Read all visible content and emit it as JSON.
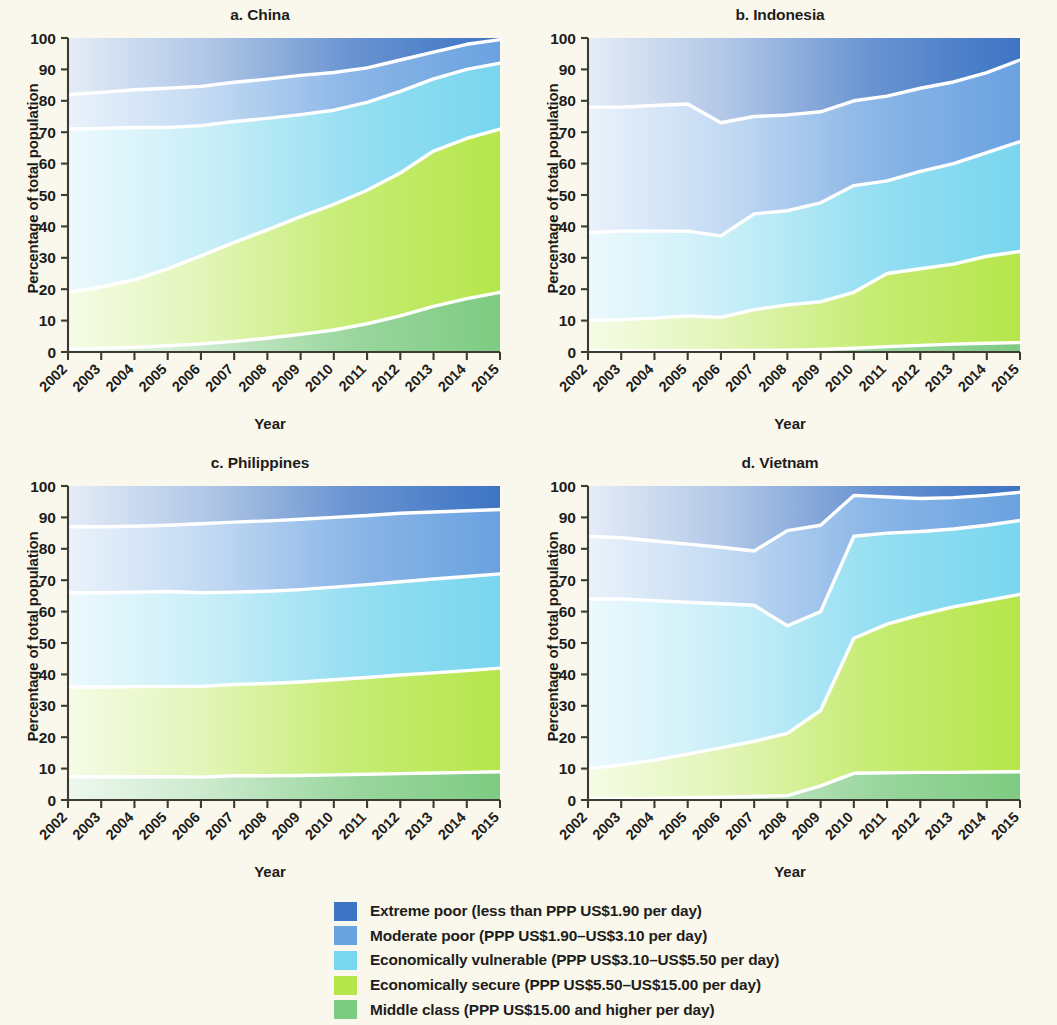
{
  "figure": {
    "background_color": "#faf8ed",
    "axis_ylabel": "Percentage of total population",
    "axis_xlabel": "Year"
  },
  "legend": {
    "position": "bottom-center",
    "items": [
      {
        "label": "Extreme poor (less than PPP US$1.90 per day)",
        "color": "#3d74c4",
        "key": "extreme_poor"
      },
      {
        "label": "Moderate poor (PPP US$1.90–US$3.10 per day)",
        "color": "#6aa2e0",
        "key": "moderate_poor"
      },
      {
        "label": "Economically vulnerable (PPP US$3.10–US$5.50 per day)",
        "color": "#78d6ee",
        "key": "economically_vulnerable"
      },
      {
        "label": "Economically secure (PPP US$5.50–US$15.00 per day)",
        "color": "#b6e64b",
        "key": "economically_secure"
      },
      {
        "label": "Middle class (PPP US$15.00 and higher per day)",
        "color": "#7ecb82",
        "key": "middle_class"
      }
    ]
  },
  "chart_data": [
    {
      "type": "area",
      "panel_id": "a",
      "title": "a. China",
      "xlabel": "Year",
      "ylabel": "Percentage of total population",
      "x": [
        2002,
        2003,
        2004,
        2005,
        2006,
        2007,
        2008,
        2009,
        2010,
        2011,
        2012,
        2013,
        2014,
        2015
      ],
      "xtick_labels": [
        "2002",
        "2003",
        "2004",
        "2005",
        "2006",
        "2007",
        "2008",
        "2009",
        "2010",
        "2011",
        "2012",
        "2013",
        "2014",
        "2015"
      ],
      "ytick_labels": [
        "0",
        "10",
        "20",
        "30",
        "40",
        "50",
        "60",
        "70",
        "80",
        "90",
        "100"
      ],
      "ylim": [
        0,
        100
      ],
      "grid": false,
      "stack_order_bottom_to_top": [
        "middle_class",
        "economically_secure",
        "economically_vulnerable",
        "moderate_poor",
        "extreme_poor"
      ],
      "series": [
        {
          "name": "Middle class (PPP US$15.00 and higher per day)",
          "color": "#7ecb82",
          "values": [
            1.0,
            1.2,
            1.5,
            2.0,
            2.6,
            3.4,
            4.4,
            5.6,
            7.0,
            9.0,
            11.5,
            14.5,
            17.0,
            19.0
          ]
        },
        {
          "name": "Economically secure (PPP US$5.50–US$15.00 per day)",
          "color": "#b6e64b",
          "values": [
            18.0,
            19.5,
            21.5,
            24.5,
            28.0,
            31.5,
            34.5,
            37.5,
            40.0,
            42.5,
            45.5,
            49.5,
            51.0,
            52.0
          ]
        },
        {
          "name": "Economically vulnerable (PPP US$3.10–US$5.50 per day)",
          "color": "#78d6ee",
          "values": [
            52.0,
            50.5,
            48.5,
            45.0,
            41.5,
            38.5,
            35.5,
            32.5,
            30.0,
            28.0,
            26.0,
            23.0,
            22.0,
            21.0
          ]
        },
        {
          "name": "Moderate poor (PPP US$1.90–US$3.10 per day)",
          "color": "#6aa2e0",
          "values": [
            11.0,
            11.5,
            12.0,
            12.5,
            12.5,
            12.5,
            12.5,
            12.5,
            12.0,
            11.0,
            10.0,
            8.5,
            8.0,
            7.5
          ]
        },
        {
          "name": "Extreme poor (less than PPP US$1.90 per day)",
          "color": "#3d74c4",
          "values": [
            18.0,
            17.3,
            16.5,
            16.0,
            15.4,
            14.1,
            13.1,
            11.9,
            11.0,
            9.5,
            7.0,
            4.5,
            2.0,
            0.5
          ]
        }
      ],
      "boundaries_cumulative": {
        "middle_class_top": [
          1.0,
          1.2,
          1.5,
          2.0,
          2.6,
          3.4,
          4.4,
          5.6,
          7.0,
          9.0,
          11.5,
          14.5,
          17.0,
          19.0
        ],
        "secure_top": [
          19.0,
          20.7,
          23.0,
          26.5,
          30.6,
          34.9,
          38.9,
          43.1,
          47.0,
          51.5,
          57.0,
          64.0,
          68.0,
          71.0
        ],
        "vulnerable_top": [
          71.0,
          71.2,
          71.5,
          71.5,
          72.1,
          73.4,
          74.4,
          75.6,
          77.0,
          79.5,
          83.0,
          87.0,
          90.0,
          92.0
        ],
        "moderate_poor_top": [
          82.0,
          82.7,
          83.5,
          84.0,
          84.6,
          85.9,
          86.9,
          88.1,
          89.0,
          90.5,
          93.0,
          95.5,
          98.0,
          99.5
        ]
      }
    },
    {
      "type": "area",
      "panel_id": "b",
      "title": "b. Indonesia",
      "xlabel": "Year",
      "ylabel": "Percentage of total population",
      "x": [
        2002,
        2003,
        2004,
        2005,
        2006,
        2007,
        2008,
        2009,
        2010,
        2011,
        2012,
        2013,
        2014,
        2015
      ],
      "xtick_labels": [
        "2002",
        "2003",
        "2004",
        "2005",
        "2006",
        "2007",
        "2008",
        "2009",
        "2010",
        "2011",
        "2012",
        "2013",
        "2014",
        "2015"
      ],
      "ytick_labels": [
        "0",
        "10",
        "20",
        "30",
        "40",
        "50",
        "60",
        "70",
        "80",
        "90",
        "100"
      ],
      "ylim": [
        0,
        100
      ],
      "grid": false,
      "stack_order_bottom_to_top": [
        "middle_class",
        "economically_secure",
        "economically_vulnerable",
        "moderate_poor",
        "extreme_poor"
      ],
      "series": [
        {
          "name": "Middle class (PPP US$15.00 and higher per day)",
          "color": "#7ecb82",
          "values": [
            0.3,
            0.3,
            0.4,
            0.4,
            0.4,
            0.5,
            0.6,
            0.8,
            1.2,
            1.7,
            2.1,
            2.5,
            2.8,
            3.0
          ]
        },
        {
          "name": "Economically secure (PPP US$5.50–US$15.00 per day)",
          "color": "#b6e64b",
          "values": [
            9.7,
            10.0,
            10.4,
            11.1,
            10.6,
            13.0,
            14.4,
            15.2,
            17.8,
            23.3,
            24.4,
            25.5,
            27.7,
            29.0
          ]
        },
        {
          "name": "Economically vulnerable (PPP US$3.10–US$5.50 per day)",
          "color": "#78d6ee",
          "values": [
            28.0,
            28.2,
            27.7,
            27.0,
            26.0,
            30.5,
            30.0,
            31.5,
            34.0,
            29.5,
            31.0,
            32.0,
            33.0,
            35.0
          ]
        },
        {
          "name": "Moderate poor (PPP US$1.90–US$3.10 per day)",
          "color": "#6aa2e0",
          "values": [
            40.0,
            39.5,
            40.0,
            40.5,
            36.0,
            31.0,
            30.5,
            29.0,
            27.0,
            27.0,
            26.5,
            26.0,
            25.5,
            26.0
          ]
        },
        {
          "name": "Extreme poor (less than PPP US$1.90 per day)",
          "color": "#3d74c4",
          "values": [
            22.0,
            22.0,
            21.5,
            21.0,
            27.0,
            25.0,
            24.5,
            23.5,
            20.0,
            18.5,
            16.0,
            14.0,
            11.0,
            7.0
          ]
        }
      ],
      "boundaries_cumulative": {
        "middle_class_top": [
          0.3,
          0.3,
          0.4,
          0.4,
          0.4,
          0.5,
          0.6,
          0.8,
          1.2,
          1.7,
          2.1,
          2.5,
          2.8,
          3.0
        ],
        "secure_top": [
          10.0,
          10.3,
          10.8,
          11.5,
          11.0,
          13.5,
          15.0,
          16.0,
          19.0,
          25.0,
          26.5,
          28.0,
          30.5,
          32.0
        ],
        "vulnerable_top": [
          38.0,
          38.5,
          38.5,
          38.5,
          37.0,
          44.0,
          45.0,
          47.5,
          53.0,
          54.5,
          57.5,
          60.0,
          63.5,
          67.0
        ],
        "moderate_poor_top": [
          78.0,
          78.0,
          78.5,
          79.0,
          73.0,
          75.0,
          75.5,
          76.5,
          80.0,
          81.5,
          84.0,
          86.0,
          89.0,
          93.0
        ]
      }
    },
    {
      "type": "area",
      "panel_id": "c",
      "title": "c. Philippines",
      "xlabel": "Year",
      "ylabel": "Percentage of total population",
      "x": [
        2002,
        2003,
        2004,
        2005,
        2006,
        2007,
        2008,
        2009,
        2010,
        2011,
        2012,
        2013,
        2014,
        2015
      ],
      "xtick_labels": [
        "2002",
        "2003",
        "2004",
        "2005",
        "2006",
        "2007",
        "2008",
        "2009",
        "2010",
        "2011",
        "2012",
        "2013",
        "2014",
        "2015"
      ],
      "ytick_labels": [
        "0",
        "10",
        "20",
        "30",
        "40",
        "50",
        "60",
        "70",
        "80",
        "90",
        "100"
      ],
      "ylim": [
        0,
        100
      ],
      "grid": false,
      "stack_order_bottom_to_top": [
        "middle_class",
        "economically_secure",
        "economically_vulnerable",
        "moderate_poor",
        "extreme_poor"
      ],
      "series": [
        {
          "name": "Middle class (PPP US$15.00 and higher per day)",
          "color": "#7ecb82",
          "values": [
            7.4,
            7.4,
            7.4,
            7.4,
            7.3,
            7.7,
            7.7,
            7.8,
            8.0,
            8.2,
            8.4,
            8.6,
            8.8,
            9.0
          ]
        },
        {
          "name": "Economically secure (PPP US$5.50–US$15.00 per day)",
          "color": "#b6e64b",
          "values": [
            28.6,
            28.6,
            28.7,
            28.8,
            28.9,
            29.1,
            29.4,
            29.8,
            30.3,
            30.8,
            31.4,
            31.9,
            32.4,
            33.0
          ]
        },
        {
          "name": "Economically vulnerable (PPP US$3.10–US$5.50 per day)",
          "color": "#78d6ee",
          "values": [
            30.0,
            30.0,
            30.1,
            30.2,
            29.8,
            29.4,
            29.4,
            29.4,
            29.5,
            29.6,
            29.7,
            29.9,
            30.0,
            30.0
          ]
        },
        {
          "name": "Moderate poor (PPP US$1.90–US$3.10 per day)",
          "color": "#6aa2e0",
          "values": [
            21.0,
            21.0,
            21.0,
            21.1,
            22.0,
            22.3,
            22.4,
            22.4,
            22.2,
            22.0,
            21.8,
            21.3,
            20.9,
            20.5
          ]
        },
        {
          "name": "Extreme poor (less than PPP US$1.90 per day)",
          "color": "#3d74c4",
          "values": [
            13.0,
            13.0,
            12.8,
            12.5,
            12.0,
            11.5,
            11.1,
            10.6,
            10.0,
            9.4,
            8.7,
            8.3,
            7.9,
            7.5
          ]
        }
      ],
      "boundaries_cumulative": {
        "middle_class_top": [
          7.4,
          7.4,
          7.4,
          7.4,
          7.3,
          7.7,
          7.7,
          7.8,
          8.0,
          8.2,
          8.4,
          8.6,
          8.8,
          9.0
        ],
        "secure_top": [
          36.0,
          36.0,
          36.1,
          36.2,
          36.2,
          36.8,
          37.1,
          37.6,
          38.3,
          39.0,
          39.8,
          40.5,
          41.2,
          42.0
        ],
        "vulnerable_top": [
          66.0,
          66.0,
          66.2,
          66.4,
          66.0,
          66.2,
          66.5,
          67.0,
          67.8,
          68.6,
          69.5,
          70.4,
          71.2,
          72.0
        ],
        "moderate_poor_top": [
          87.0,
          87.0,
          87.2,
          87.5,
          88.0,
          88.5,
          88.9,
          89.4,
          90.0,
          90.6,
          91.3,
          91.7,
          92.1,
          92.5
        ]
      }
    },
    {
      "type": "area",
      "panel_id": "d",
      "title": "d. Vietnam",
      "xlabel": "Year",
      "ylabel": "Percentage of total population",
      "x": [
        2002,
        2003,
        2004,
        2005,
        2006,
        2007,
        2008,
        2009,
        2010,
        2011,
        2012,
        2013,
        2014,
        2015
      ],
      "xtick_labels": [
        "2002",
        "2003",
        "2004",
        "2005",
        "2006",
        "2007",
        "2008",
        "2009",
        "2010",
        "2011",
        "2012",
        "2013",
        "2014",
        "2015"
      ],
      "ytick_labels": [
        "0",
        "10",
        "20",
        "30",
        "40",
        "50",
        "60",
        "70",
        "80",
        "90",
        "100"
      ],
      "ylim": [
        0,
        100
      ],
      "grid": false,
      "stack_order_bottom_to_top": [
        "middle_class",
        "economically_secure",
        "economically_vulnerable",
        "moderate_poor",
        "extreme_poor"
      ],
      "series": [
        {
          "name": "Middle class (PPP US$15.00 and higher per day)",
          "color": "#7ecb82",
          "values": [
            0.3,
            0.4,
            0.5,
            0.7,
            0.9,
            1.1,
            1.4,
            4.5,
            8.5,
            8.7,
            8.8,
            8.8,
            8.9,
            9.0
          ]
        },
        {
          "name": "Economically secure (PPP US$5.50–US$15.00 per day)",
          "color": "#b6e64b",
          "values": [
            9.7,
            10.8,
            12.2,
            13.9,
            15.7,
            17.6,
            19.8,
            24.0,
            43.0,
            47.3,
            50.2,
            52.7,
            54.6,
            56.5
          ]
        },
        {
          "name": "Economically vulnerable (PPP US$3.10–US$5.50 per day)",
          "color": "#78d6ee",
          "values": [
            54.0,
            52.8,
            50.8,
            48.4,
            45.9,
            43.3,
            34.3,
            31.5,
            32.5,
            29.0,
            26.5,
            24.8,
            24.0,
            23.5
          ]
        },
        {
          "name": "Moderate poor (PPP US$1.90–US$3.10 per day)",
          "color": "#6aa2e0",
          "values": [
            20.0,
            19.5,
            19.0,
            18.5,
            18.0,
            17.3,
            30.3,
            27.5,
            13.0,
            11.5,
            10.5,
            10.0,
            9.5,
            9.0
          ]
        },
        {
          "name": "Extreme poor (less than PPP US$1.90 per day)",
          "color": "#3d74c4",
          "values": [
            16.0,
            16.5,
            17.5,
            18.5,
            19.5,
            20.7,
            14.2,
            12.5,
            3.0,
            3.5,
            4.0,
            3.7,
            3.0,
            2.0
          ]
        }
      ],
      "boundaries_cumulative": {
        "middle_class_top": [
          0.3,
          0.4,
          0.5,
          0.7,
          0.9,
          1.1,
          1.4,
          4.5,
          8.5,
          8.7,
          8.8,
          8.8,
          8.9,
          9.0
        ],
        "secure_top": [
          10.0,
          11.2,
          12.7,
          14.6,
          16.6,
          18.7,
          21.2,
          28.5,
          51.5,
          56.0,
          59.0,
          61.5,
          63.5,
          65.5
        ],
        "vulnerable_top": [
          64.0,
          64.0,
          63.5,
          63.0,
          62.5,
          62.0,
          55.5,
          60.0,
          84.0,
          85.0,
          85.5,
          86.3,
          87.5,
          89.0
        ],
        "moderate_poor_top": [
          84.0,
          83.5,
          82.5,
          81.5,
          80.5,
          79.3,
          85.8,
          87.5,
          97.0,
          96.5,
          96.0,
          96.3,
          97.0,
          98.0
        ]
      }
    }
  ]
}
